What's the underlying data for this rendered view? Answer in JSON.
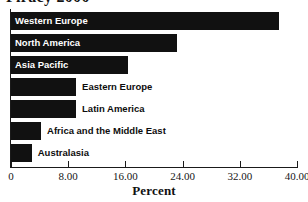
{
  "figure": {
    "title_clipped": "Piracy 2000",
    "background_color": "#ffffff",
    "bar_color": "#111111",
    "axis_color": "#1a1a1a",
    "inside_label_color": "#ffffff",
    "outside_label_color": "#0d0d0d"
  },
  "chart_data": {
    "type": "bar",
    "orientation": "horizontal",
    "title": "Piracy 2000",
    "xlabel": "Percent",
    "ylabel": "",
    "xlim": [
      0,
      40
    ],
    "grid": false,
    "legend": false,
    "tick_labels": [
      "0",
      "8.00",
      "16.00",
      "24.00",
      "32.00",
      "40.00"
    ],
    "tick_values": [
      0,
      8,
      16,
      24,
      32,
      40
    ],
    "categories": [
      "Western Europe",
      "North America",
      "Asia Pacific",
      "Eastern Europe",
      "Latin America",
      "Africa and the Middle East",
      "Australasia"
    ],
    "values": [
      37.5,
      23.2,
      16.4,
      9.1,
      9.1,
      4.2,
      2.9
    ],
    "label_placement": [
      "inside",
      "inside",
      "inside",
      "outside",
      "outside",
      "outside",
      "outside"
    ]
  }
}
